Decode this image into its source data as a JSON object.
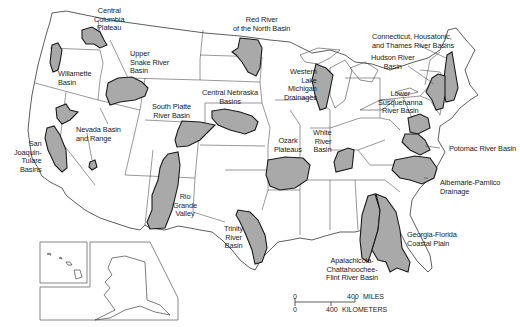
{
  "map": {
    "type": "reference map",
    "region": "Conterminous United States with Alaska and Hawaii insets",
    "colors": {
      "basin_fill": "#a9a9a9",
      "basin_outline": "#1a1a1a",
      "state_lines": "#3a3a3a",
      "background": "#ffffff"
    },
    "basins": [
      {
        "id": "central-columbia-plateau",
        "label": "Central\nColumbia\nPlateau"
      },
      {
        "id": "willamette-basin",
        "label": "Willamette\nBasin"
      },
      {
        "id": "upper-snake-river-basin",
        "label": "Upper\nSnake River\nBasin"
      },
      {
        "id": "red-river-of-the-north-basin",
        "label": "Red River\nof the North Basin"
      },
      {
        "id": "central-nebraska-basins",
        "label": "Central Nebraska\nBasins"
      },
      {
        "id": "south-platte-river-basin",
        "label": "South Platte\nRiver Basin"
      },
      {
        "id": "nevada-basin-and-range",
        "label": "Nevada Basin\nand Range"
      },
      {
        "id": "san-joaquin-tulare-basins",
        "label": "San\nJoaquin-\nTulare\nBasins"
      },
      {
        "id": "rio-grande-valley",
        "label": "Rio\nGrande\nValley"
      },
      {
        "id": "western-lake-michigan-drainages",
        "label": "Western\nLake\nMichigan\nDrainages"
      },
      {
        "id": "ozark-plateaus",
        "label": "Ozark\nPlateaus"
      },
      {
        "id": "white-river-basin",
        "label": "White\nRiver\nBasin"
      },
      {
        "id": "trinity-river-basin",
        "label": "Trinity\nRiver\nBasin"
      },
      {
        "id": "connecticut-housatonic-thames",
        "label": "Connecticut, Housatonic,\nand Thames River Basins"
      },
      {
        "id": "hudson-river-basin",
        "label": "Hudson River\nBasin"
      },
      {
        "id": "lower-susquehanna-river-basin",
        "label": "Lower\nSusquehanna\nRiver Basin"
      },
      {
        "id": "potomac-river-basin",
        "label": "Potomac River Basin"
      },
      {
        "id": "albemarle-pamlico-drainage",
        "label": "Albemarle-Pamlico\nDrainage"
      },
      {
        "id": "georgia-florida-coastal-plain",
        "label": "Georgia-Florida\nCoastal Plain"
      },
      {
        "id": "apalachicola-chattahoochee-flint",
        "label": "Apalachicola-\nChattahoochee-\nFlint River Basin"
      }
    ],
    "scale_bar": {
      "miles_zero": "0",
      "miles_value": "400",
      "miles_unit": "MILES",
      "km_zero": "0",
      "km_value": "400",
      "km_unit": "KILOMETERS"
    }
  }
}
